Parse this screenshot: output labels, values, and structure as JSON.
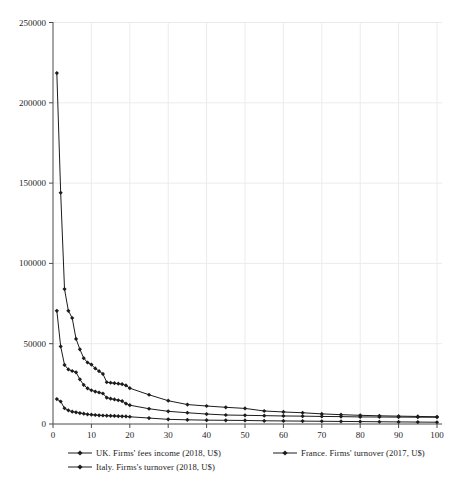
{
  "page": {
    "background": "#ffffff"
  },
  "chart_data": {
    "type": "line",
    "title": "",
    "xlabel": "",
    "ylabel": "",
    "x": [
      1,
      2,
      3,
      4,
      5,
      6,
      7,
      8,
      9,
      10,
      11,
      12,
      13,
      14,
      15,
      16,
      17,
      18,
      19,
      20,
      25,
      30,
      35,
      40,
      45,
      50,
      55,
      60,
      65,
      70,
      75,
      80,
      85,
      90,
      95,
      100
    ],
    "series": [
      {
        "name": "UK. Firms' fees income (2018, U$)",
        "color": "#1c1c1c",
        "marker": "diamond",
        "values": [
          218500,
          144000,
          84000,
          70500,
          66000,
          53000,
          46500,
          41000,
          38300,
          37000,
          34600,
          32900,
          31200,
          26000,
          25700,
          25400,
          25100,
          24800,
          24000,
          22300,
          18200,
          14500,
          12100,
          11200,
          10400,
          9700,
          8100,
          7500,
          7000,
          6300,
          5800,
          5400,
          5100,
          4900,
          4700,
          4500
        ]
      },
      {
        "name": "France. Firms' turnover (2017, U$)",
        "color": "#1c1c1c",
        "marker": "diamond",
        "values": [
          70500,
          48300,
          36800,
          34000,
          33000,
          32200,
          27800,
          24300,
          22200,
          21000,
          20200,
          19600,
          19000,
          16400,
          15800,
          15300,
          14800,
          14300,
          12700,
          11700,
          9500,
          7900,
          7000,
          6200,
          5600,
          5400,
          5200,
          5000,
          4900,
          4700,
          4600,
          4400,
          4350,
          4300,
          4250,
          4200
        ]
      },
      {
        "name": "Italy. Firms's turnover (2018, U$)",
        "color": "#1c1c1c",
        "marker": "diamond",
        "values": [
          15500,
          14000,
          9800,
          8500,
          7700,
          7300,
          6800,
          6400,
          6000,
          5800,
          5600,
          5400,
          5300,
          5200,
          5100,
          5000,
          4900,
          4800,
          4700,
          4500,
          3700,
          2900,
          2600,
          2400,
          2300,
          2200,
          2000,
          1900,
          1800,
          1700,
          1600,
          1500,
          1400,
          1300,
          1200,
          1100
        ]
      }
    ],
    "xlim": [
      0,
      100
    ],
    "ylim": [
      0,
      250000
    ],
    "x_ticks": [
      0,
      10,
      20,
      30,
      40,
      50,
      60,
      70,
      80,
      90,
      100
    ],
    "x_tick_labels": [
      "0",
      "10",
      "20",
      "30",
      "40",
      "50",
      "60",
      "70",
      "80",
      "90",
      "100"
    ],
    "y_ticks": [
      0,
      50000,
      100000,
      150000,
      200000,
      250000
    ],
    "y_tick_labels": [
      "0",
      "50000",
      "100000",
      "150000",
      "200000",
      "250000"
    ],
    "grid": true,
    "grid_color": "#ebebeb",
    "axis_color": "#4a4a4a",
    "tick_label_color": "#1f1f1f",
    "legend_position": "bottom"
  }
}
